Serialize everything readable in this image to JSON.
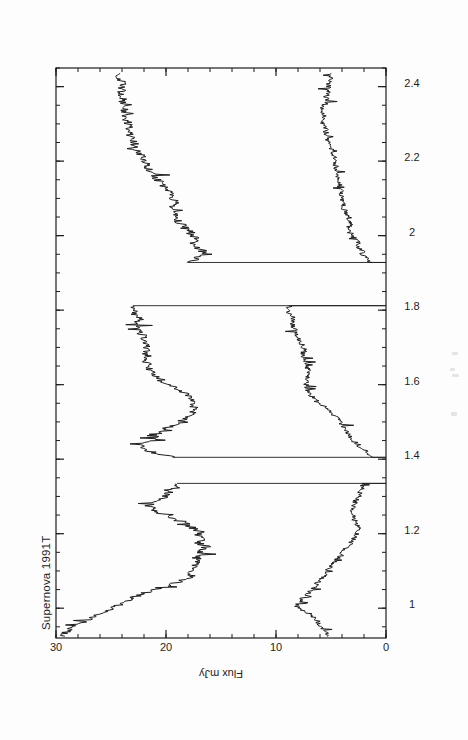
{
  "figure": {
    "title": "Supernova 1991T",
    "background_color": "#fdfdfd",
    "ink_color": "#1d1d1d",
    "rotation_note": "printed rotated 90 degrees counter-clockwise"
  },
  "chart_data": {
    "type": "line",
    "title": "Supernova 1991T",
    "xlabel": "",
    "ylabel": "Flux  mJy",
    "xlim": [
      0.92,
      2.45
    ],
    "ylim": [
      0,
      30
    ],
    "grid": false,
    "legend": null,
    "x_ticks": [
      1,
      1.2,
      1.4,
      1.6,
      1.8,
      2,
      2.2,
      2.4
    ],
    "x_tick_labels": [
      "1",
      "1.2",
      "1.4",
      "1.6",
      "1.8",
      "2",
      "2.2",
      "2.4"
    ],
    "x_minor_tick_step": 0.05,
    "y_ticks": [
      0,
      10,
      20,
      30
    ],
    "y_tick_labels": [
      "0",
      "10",
      "20",
      "30"
    ],
    "y_minor_tick_step": 2,
    "gaps": [
      [
        1.335,
        1.405
      ],
      [
        1.812,
        1.928
      ]
    ],
    "series": [
      {
        "name": "upper-spectrum",
        "x": [
          0.925,
          0.935,
          0.945,
          0.955,
          0.965,
          0.975,
          0.985,
          0.995,
          1.005,
          1.015,
          1.025,
          1.035,
          1.045,
          1.055,
          1.065,
          1.075,
          1.085,
          1.095,
          1.105,
          1.115,
          1.125,
          1.135,
          1.145,
          1.155,
          1.165,
          1.175,
          1.185,
          1.195,
          1.205,
          1.215,
          1.225,
          1.235,
          1.245,
          1.255,
          1.265,
          1.275,
          1.285,
          1.295,
          1.305,
          1.315,
          1.325,
          1.335,
          1.405,
          1.415,
          1.425,
          1.435,
          1.445,
          1.455,
          1.465,
          1.475,
          1.485,
          1.495,
          1.505,
          1.515,
          1.525,
          1.535,
          1.545,
          1.555,
          1.565,
          1.575,
          1.585,
          1.595,
          1.605,
          1.615,
          1.625,
          1.635,
          1.645,
          1.655,
          1.665,
          1.675,
          1.685,
          1.695,
          1.705,
          1.715,
          1.725,
          1.735,
          1.745,
          1.755,
          1.765,
          1.775,
          1.785,
          1.795,
          1.805,
          1.812,
          1.928,
          1.94,
          1.95,
          1.96,
          1.97,
          1.98,
          1.99,
          2.0,
          2.01,
          2.02,
          2.03,
          2.04,
          2.05,
          2.06,
          2.07,
          2.08,
          2.09,
          2.1,
          2.11,
          2.12,
          2.13,
          2.14,
          2.15,
          2.165,
          2.18,
          2.195,
          2.21,
          2.225,
          2.24,
          2.255,
          2.27,
          2.285,
          2.3,
          2.315,
          2.33,
          2.345,
          2.36,
          2.375,
          2.39,
          2.405,
          2.42,
          2.435
        ],
        "y": [
          29.6,
          29.1,
          28.6,
          28.2,
          27.4,
          26.6,
          26.0,
          25.3,
          24.6,
          23.9,
          23.2,
          22.4,
          21.6,
          20.6,
          19.5,
          18.5,
          17.7,
          17.6,
          17.5,
          17.3,
          17.0,
          17.2,
          16.6,
          17.1,
          16.3,
          17.0,
          16.5,
          17.2,
          16.9,
          17.6,
          18.0,
          18.9,
          19.8,
          20.6,
          21.2,
          21.5,
          21.0,
          20.4,
          19.9,
          19.4,
          19.0,
          19.0,
          19.4,
          20.8,
          21.9,
          22.2,
          21.6,
          20.9,
          20.6,
          20.3,
          19.8,
          19.0,
          18.4,
          17.9,
          17.6,
          17.5,
          17.4,
          17.5,
          17.8,
          18.2,
          18.8,
          19.5,
          20.1,
          20.6,
          21.0,
          21.4,
          21.6,
          21.7,
          21.8,
          21.7,
          21.8,
          21.6,
          21.7,
          21.9,
          22.0,
          22.2,
          22.4,
          22.6,
          22.6,
          22.3,
          22.8,
          23.0,
          23.0,
          23.0,
          18.0,
          17.1,
          16.8,
          16.7,
          17.3,
          17.5,
          17.1,
          17.6,
          17.8,
          18.3,
          18.6,
          18.9,
          19.0,
          19.2,
          19.4,
          19.4,
          19.2,
          19.4,
          19.6,
          19.8,
          20.0,
          20.4,
          20.8,
          21.2,
          21.6,
          21.9,
          22.2,
          22.5,
          22.8,
          23.0,
          23.2,
          23.4,
          23.5,
          23.6,
          23.7,
          23.8,
          23.9,
          24.0,
          24.0,
          24.0,
          24.1,
          24.2
        ]
      },
      {
        "name": "lower-spectrum",
        "x": [
          0.925,
          0.935,
          0.945,
          0.955,
          0.965,
          0.975,
          0.985,
          0.995,
          1.005,
          1.015,
          1.025,
          1.035,
          1.045,
          1.055,
          1.065,
          1.075,
          1.085,
          1.095,
          1.105,
          1.115,
          1.125,
          1.135,
          1.145,
          1.155,
          1.165,
          1.175,
          1.185,
          1.195,
          1.205,
          1.215,
          1.225,
          1.235,
          1.245,
          1.255,
          1.265,
          1.275,
          1.285,
          1.295,
          1.305,
          1.315,
          1.325,
          1.335,
          1.405,
          1.415,
          1.425,
          1.435,
          1.445,
          1.455,
          1.465,
          1.475,
          1.485,
          1.495,
          1.505,
          1.515,
          1.525,
          1.535,
          1.545,
          1.555,
          1.565,
          1.575,
          1.585,
          1.595,
          1.605,
          1.615,
          1.625,
          1.635,
          1.645,
          1.655,
          1.665,
          1.675,
          1.685,
          1.695,
          1.705,
          1.715,
          1.725,
          1.735,
          1.745,
          1.755,
          1.765,
          1.775,
          1.785,
          1.795,
          1.805,
          1.812,
          1.928,
          1.94,
          1.95,
          1.96,
          1.97,
          1.98,
          1.99,
          2.0,
          2.01,
          2.02,
          2.03,
          2.04,
          2.05,
          2.06,
          2.07,
          2.08,
          2.09,
          2.1,
          2.11,
          2.12,
          2.13,
          2.14,
          2.15,
          2.165,
          2.18,
          2.195,
          2.21,
          2.225,
          2.24,
          2.255,
          2.27,
          2.285,
          2.3,
          2.315,
          2.33,
          2.345,
          2.36,
          2.375,
          2.39,
          2.405,
          2.42,
          2.435
        ],
        "y": [
          5.2,
          5.4,
          5.7,
          6.0,
          6.2,
          6.6,
          7.0,
          7.6,
          8.1,
          8.0,
          7.6,
          7.2,
          6.9,
          6.6,
          6.3,
          6.0,
          5.7,
          5.5,
          5.2,
          5.0,
          4.7,
          4.4,
          4.1,
          3.8,
          3.5,
          3.2,
          2.9,
          2.7,
          2.5,
          2.5,
          2.6,
          2.8,
          3.0,
          3.1,
          3.1,
          3.0,
          2.8,
          2.6,
          2.4,
          2.3,
          2.2,
          2.2,
          1.2,
          1.6,
          2.0,
          2.4,
          2.8,
          3.1,
          3.4,
          3.6,
          3.8,
          4.0,
          4.3,
          4.6,
          5.0,
          5.4,
          5.8,
          6.2,
          6.6,
          6.9,
          7.1,
          7.2,
          7.3,
          7.2,
          7.1,
          7.0,
          7.1,
          7.3,
          7.5,
          7.6,
          7.5,
          7.4,
          7.6,
          7.8,
          8.0,
          8.1,
          8.3,
          8.4,
          8.5,
          8.4,
          8.6,
          8.8,
          8.8,
          8.8,
          1.5,
          1.8,
          2.2,
          2.1,
          2.5,
          2.4,
          2.8,
          3.1,
          3.3,
          3.4,
          3.3,
          3.2,
          3.4,
          3.6,
          3.8,
          3.9,
          4.0,
          4.1,
          4.0,
          4.1,
          4.2,
          4.3,
          4.3,
          4.4,
          4.5,
          4.6,
          4.7,
          4.9,
          5.1,
          5.3,
          5.4,
          5.5,
          5.6,
          5.7,
          5.7,
          5.6,
          5.5,
          5.4,
          5.3,
          5.2,
          5.1,
          5.0
        ]
      }
    ]
  }
}
